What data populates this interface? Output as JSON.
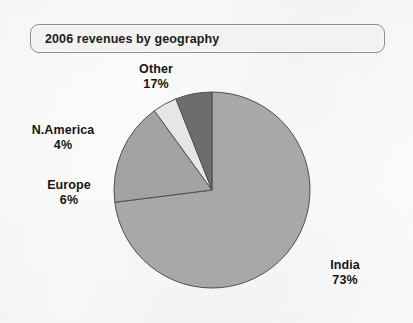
{
  "title": {
    "text": "2006 revenues by geography"
  },
  "chart_data": {
    "type": "pie",
    "title": "2006 revenues by geography",
    "xlabel": "",
    "ylabel": "",
    "units": "percent",
    "start_angle_deg": 0,
    "direction": "clockwise",
    "legend_position": "none",
    "labels_position": "outside",
    "grid": false,
    "categories": [
      "India",
      "Other",
      "N.America",
      "Europe"
    ],
    "values": [
      73,
      17,
      4,
      6
    ],
    "slices": [
      {
        "name": "India",
        "label": "India",
        "value": 73,
        "value_label": "73%",
        "color": "#a8a8a8",
        "start_deg": 0,
        "end_deg": 262.8
      },
      {
        "name": "Other",
        "label": "Other",
        "value": 17,
        "value_label": "17%",
        "color": "#a3a3a3",
        "start_deg": 262.8,
        "end_deg": 324.0
      },
      {
        "name": "N.America",
        "label": "N.America",
        "value": 4,
        "value_label": "4%",
        "color": "#e6e6e6",
        "start_deg": 324.0,
        "end_deg": 338.4
      },
      {
        "name": "Europe",
        "label": "Europe",
        "value": 6,
        "value_label": "6%",
        "color": "#6d6d6d",
        "start_deg": 338.4,
        "end_deg": 360.0
      }
    ]
  },
  "labels": {
    "other": {
      "name": "Other",
      "pct": "17%"
    },
    "namerica": {
      "name": "N.America",
      "pct": "4%"
    },
    "europe": {
      "name": "Europe",
      "pct": "6%"
    },
    "india": {
      "name": "India",
      "pct": "73%"
    }
  },
  "colors": {
    "page_background": "#fbfbfb",
    "title_box_fill": "#f2f2f2",
    "title_box_border": "#8d8d8d",
    "text": "#161616",
    "slice_outline": "#4f4f4f",
    "india": "#a8a8a8",
    "other": "#a3a3a3",
    "namerica": "#e6e6e6",
    "europe": "#6d6d6d"
  }
}
